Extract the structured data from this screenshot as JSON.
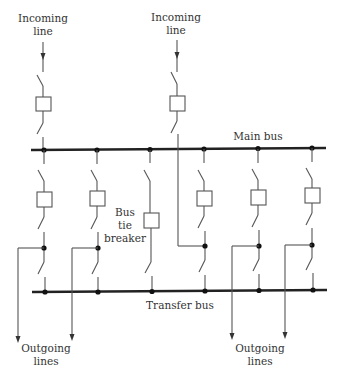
{
  "diagram": {
    "type": "single-line busbar scheme",
    "labels": {
      "incoming_1": [
        "Incoming",
        "line"
      ],
      "incoming_2": [
        "Incoming",
        "line"
      ],
      "main_bus": "Main bus",
      "transfer_bus": "Transfer bus",
      "bus_tie": [
        "Bus",
        "tie",
        "breaker"
      ],
      "outgoing_left": [
        "Outgoing",
        "lines"
      ],
      "outgoing_right": [
        "Outgoing",
        "lines"
      ]
    },
    "colors": {
      "line": "#555555",
      "bus": "#222222",
      "text": "#333333"
    },
    "buses": [
      "Main bus",
      "Transfer bus"
    ],
    "feeders": [
      {
        "id": "feeder-1",
        "type": "outgoing"
      },
      {
        "id": "feeder-2",
        "type": "outgoing"
      },
      {
        "id": "bus-tie",
        "type": "bus tie breaker"
      },
      {
        "id": "feeder-4",
        "type": "incoming (from line 2)"
      },
      {
        "id": "feeder-5",
        "type": "outgoing"
      },
      {
        "id": "feeder-6",
        "type": "outgoing"
      }
    ]
  }
}
